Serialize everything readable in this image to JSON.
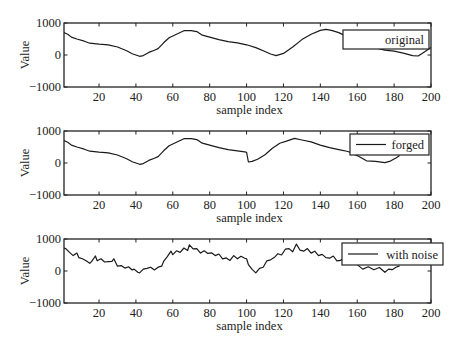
{
  "figure": {
    "width": 459,
    "height": 349,
    "line_color": "#1a1a1a",
    "axis_color": "#222222",
    "background": "#ffffff"
  },
  "chart_data": [
    {
      "type": "line",
      "title": "",
      "xlabel": "sample index",
      "ylabel": "Value",
      "xlim": [
        1,
        200
      ],
      "ylim": [
        -1000,
        1000
      ],
      "xticks": [
        20,
        40,
        60,
        80,
        100,
        120,
        140,
        160,
        180,
        200
      ],
      "yticks": [
        -1000,
        0,
        1000
      ],
      "yticklabels": [
        "−1000",
        "0",
        "1000"
      ],
      "grid": false,
      "legend": {
        "position": "upper right",
        "entries": [
          "original"
        ],
        "show_line_sample": false
      },
      "series": [
        {
          "name": "original",
          "x": [
            1,
            3,
            5,
            8,
            12,
            15,
            20,
            25,
            30,
            35,
            38,
            40,
            42,
            44,
            47,
            50,
            52,
            55,
            58,
            62,
            66,
            70,
            73,
            76,
            80,
            85,
            90,
            95,
            100,
            105,
            110,
            113,
            116,
            120,
            125,
            130,
            135,
            140,
            143,
            146,
            150,
            155,
            160,
            165,
            170,
            175,
            180,
            185,
            190,
            193,
            196,
            200
          ],
          "values": [
            700,
            650,
            560,
            500,
            430,
            370,
            340,
            320,
            250,
            130,
            40,
            0,
            -40,
            -20,
            80,
            150,
            200,
            380,
            540,
            650,
            760,
            760,
            730,
            620,
            560,
            480,
            420,
            380,
            320,
            230,
            110,
            30,
            -20,
            50,
            250,
            480,
            650,
            770,
            800,
            770,
            700,
            560,
            400,
            300,
            220,
            150,
            120,
            60,
            -20,
            -30,
            80,
            230
          ]
        }
      ]
    },
    {
      "type": "line",
      "title": "",
      "xlabel": "sample index",
      "ylabel": "Value",
      "xlim": [
        1,
        200
      ],
      "ylim": [
        -1000,
        1000
      ],
      "xticks": [
        20,
        40,
        60,
        80,
        100,
        120,
        140,
        160,
        180,
        200
      ],
      "yticks": [
        -1000,
        0,
        1000
      ],
      "yticklabels": [
        "−1000",
        "0",
        "1000"
      ],
      "grid": false,
      "legend": {
        "position": "upper right",
        "entries": [
          "forged"
        ],
        "show_line_sample": true
      },
      "series": [
        {
          "name": "forged",
          "x": [
            1,
            3,
            5,
            8,
            12,
            15,
            20,
            25,
            30,
            35,
            38,
            40,
            42,
            44,
            47,
            50,
            52,
            55,
            58,
            62,
            66,
            70,
            73,
            76,
            80,
            85,
            90,
            95,
            99,
            100,
            101,
            103,
            106,
            110,
            114,
            118,
            122,
            126,
            130,
            135,
            140,
            145,
            150,
            155,
            160,
            165,
            170,
            175,
            178,
            181,
            183
          ],
          "values": [
            700,
            650,
            560,
            500,
            430,
            370,
            340,
            320,
            250,
            130,
            40,
            0,
            -40,
            -20,
            80,
            150,
            200,
            380,
            540,
            650,
            760,
            760,
            730,
            620,
            560,
            480,
            420,
            380,
            350,
            330,
            30,
            50,
            120,
            260,
            460,
            620,
            690,
            770,
            720,
            660,
            560,
            480,
            420,
            360,
            230,
            70,
            50,
            10,
            60,
            160,
            230
          ]
        }
      ]
    },
    {
      "type": "line",
      "title": "",
      "xlabel": "sample index",
      "ylabel": "Value",
      "xlim": [
        1,
        200
      ],
      "ylim": [
        -1000,
        1000
      ],
      "xticks": [
        20,
        40,
        60,
        80,
        100,
        120,
        140,
        160,
        180,
        200
      ],
      "yticks": [
        -1000,
        0,
        1000
      ],
      "yticklabels": [
        "−1000",
        "0",
        "1000"
      ],
      "grid": false,
      "legend": {
        "position": "upper right",
        "entries": [
          "with noise"
        ],
        "show_line_sample": true
      },
      "series": [
        {
          "name": "with noise",
          "x": [
            1,
            2,
            4,
            6,
            8,
            9,
            11,
            13,
            15,
            16,
            18,
            19,
            21,
            23,
            25,
            27,
            28,
            30,
            32,
            34,
            36,
            38,
            39,
            41,
            42,
            44,
            46,
            48,
            50,
            52,
            54,
            55,
            57,
            59,
            60,
            62,
            64,
            66,
            68,
            69,
            71,
            73,
            75,
            77,
            79,
            81,
            83,
            85,
            87,
            89,
            91,
            93,
            95,
            97,
            99,
            100,
            101,
            103,
            105,
            107,
            109,
            111,
            113,
            115,
            117,
            119,
            121,
            123,
            125,
            127,
            129,
            131,
            133,
            135,
            137,
            139,
            141,
            143,
            145,
            147,
            149,
            151,
            153,
            155,
            157,
            160,
            163,
            166,
            169,
            172,
            175,
            177,
            179,
            181,
            183
          ],
          "values": [
            720,
            700,
            580,
            480,
            560,
            420,
            380,
            320,
            240,
            300,
            470,
            320,
            380,
            280,
            290,
            300,
            380,
            150,
            170,
            90,
            130,
            30,
            60,
            -40,
            -60,
            60,
            80,
            120,
            30,
            120,
            150,
            300,
            450,
            620,
            510,
            630,
            580,
            720,
            640,
            820,
            690,
            700,
            560,
            630,
            550,
            570,
            480,
            530,
            380,
            410,
            330,
            480,
            380,
            460,
            400,
            380,
            200,
            50,
            -60,
            80,
            120,
            320,
            350,
            420,
            540,
            500,
            680,
            700,
            600,
            840,
            650,
            620,
            700,
            560,
            620,
            480,
            520,
            420,
            400,
            470,
            320,
            330,
            420,
            280,
            300,
            200,
            60,
            130,
            40,
            110,
            -40,
            60,
            40,
            120,
            160
          ]
        }
      ]
    }
  ],
  "subplots": [
    {
      "legend_label": "original",
      "xlabel": "sample index",
      "ylabel": "Value"
    },
    {
      "legend_label": "forged",
      "xlabel": "sample index",
      "ylabel": "Value"
    },
    {
      "legend_label": "with noise",
      "xlabel": "sample index",
      "ylabel": "Value"
    }
  ]
}
